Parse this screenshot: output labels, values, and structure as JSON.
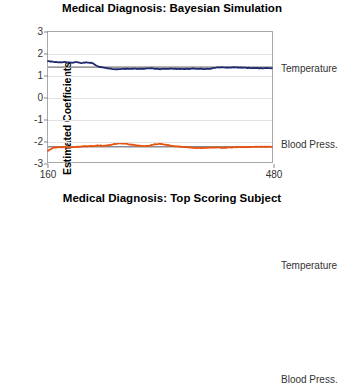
{
  "charts": [
    {
      "title": "Medical Diagnosis: Bayesian Simulation",
      "ylabel": "Estimated Coefficients",
      "yticks": [
        "3",
        "2",
        "1",
        "0",
        "-1",
        "-2",
        "-3"
      ],
      "xticks": [
        "160",
        "480"
      ],
      "legend": {
        "temperature": "Temperature",
        "blood": "Blood Press."
      }
    },
    {
      "title": "Medical Diagnosis: Top Scoring Subject",
      "ylabel": "Estimated Coefficients",
      "yticks": [
        "3",
        "2",
        "1",
        "0",
        "-1",
        "-2",
        "-3",
        "-4"
      ],
      "xticks": [
        "160",
        "480"
      ],
      "legend": {
        "temperature": "Temperature",
        "blood": "Blood Press."
      }
    }
  ],
  "chart_data": [
    {
      "type": "line",
      "title": "Medical Diagnosis: Bayesian Simulation",
      "xlabel": "",
      "ylabel": "Estimated Coefficients",
      "xlim": [
        160,
        480
      ],
      "ylim": [
        -3,
        3
      ],
      "xticks": [
        160,
        480
      ],
      "yticks": [
        -3,
        -2,
        -1,
        0,
        1,
        2,
        3
      ],
      "grid": "horizontal-light",
      "legend_position": "right-outside",
      "reference_lines": [
        {
          "name": "Temperature true value",
          "y": 1.38,
          "color": "#404040"
        },
        {
          "name": "Blood Press. true value",
          "y": -2.3,
          "color": "#404040"
        }
      ],
      "series": [
        {
          "name": "Temperature",
          "color": "#1f2a6e",
          "x": [
            160,
            168,
            176,
            184,
            192,
            200,
            208,
            216,
            224,
            232,
            240,
            248,
            256,
            264,
            272,
            280,
            288,
            296,
            304,
            312,
            320,
            328,
            336,
            344,
            352,
            360,
            368,
            376,
            384,
            392,
            400,
            408,
            416,
            424,
            432,
            440,
            448,
            456,
            464,
            472,
            480
          ],
          "values": [
            1.66,
            1.62,
            1.6,
            1.62,
            1.58,
            1.61,
            1.57,
            1.6,
            1.56,
            1.4,
            1.36,
            1.31,
            1.28,
            1.29,
            1.3,
            1.31,
            1.3,
            1.31,
            1.32,
            1.31,
            1.29,
            1.3,
            1.31,
            1.3,
            1.29,
            1.3,
            1.31,
            1.3,
            1.29,
            1.31,
            1.36,
            1.37,
            1.36,
            1.37,
            1.36,
            1.35,
            1.34,
            1.34,
            1.33,
            1.33,
            1.33
          ]
        },
        {
          "name": "Blood Press.",
          "color": "#e8520e",
          "x": [
            160,
            168,
            176,
            184,
            192,
            200,
            208,
            216,
            224,
            232,
            240,
            248,
            256,
            264,
            272,
            280,
            288,
            296,
            304,
            312,
            320,
            328,
            336,
            344,
            352,
            360,
            368,
            376,
            384,
            392,
            400,
            408,
            416,
            424,
            432,
            440,
            448,
            456,
            464,
            472,
            480
          ],
          "values": [
            -2.48,
            -2.33,
            -2.32,
            -2.31,
            -2.32,
            -2.31,
            -2.28,
            -2.27,
            -2.26,
            -2.24,
            -2.25,
            -2.22,
            -2.16,
            -2.14,
            -2.16,
            -2.2,
            -2.24,
            -2.27,
            -2.26,
            -2.18,
            -2.17,
            -2.2,
            -2.25,
            -2.28,
            -2.3,
            -2.32,
            -2.34,
            -2.36,
            -2.35,
            -2.34,
            -2.33,
            -2.34,
            -2.33,
            -2.32,
            -2.32,
            -2.31,
            -2.31,
            -2.3,
            -2.3,
            -2.3,
            -2.3
          ]
        }
      ]
    },
    {
      "type": "line",
      "title": "Medical Diagnosis: Top Scoring Subject",
      "xlabel": "",
      "ylabel": "Estimated Coefficients",
      "xlim": [
        160,
        480
      ],
      "ylim": [
        -4,
        3
      ],
      "xticks": [
        160,
        480
      ],
      "yticks": [
        -4,
        -3,
        -2,
        -1,
        0,
        1,
        2,
        3
      ],
      "grid": "horizontal-light",
      "legend_position": "right-outside",
      "reference_lines": [
        {
          "name": "Temperature true value",
          "y": 1.38,
          "color": "#404040"
        },
        {
          "name": "Blood Press. true value",
          "y": -2.3,
          "color": "#404040"
        }
      ],
      "series": [
        {
          "name": "Temperature",
          "color": "#1f2a6e",
          "x": [
            160,
            168,
            176,
            184,
            192,
            200,
            208,
            216,
            224,
            232,
            240,
            248,
            256,
            264,
            272,
            280,
            288,
            296,
            304,
            312,
            320,
            328,
            336,
            344,
            352,
            360,
            368,
            376,
            384,
            392,
            400,
            408,
            416,
            424,
            432,
            440,
            448,
            456,
            464,
            472,
            480
          ],
          "values": [
            1.32,
            1.33,
            1.45,
            1.66,
            1.82,
            1.92,
            1.98,
            2.02,
            2.05,
            2.08,
            2.12,
            2.13,
            2.15,
            2.18,
            2.21,
            2.24,
            2.28,
            2.33,
            2.4,
            2.48,
            2.58,
            2.65,
            2.63,
            2.52,
            2.34,
            2.26,
            2.24,
            2.26,
            2.23,
            2.24,
            2.27,
            2.3,
            2.28,
            2.29,
            2.27,
            2.28,
            2.29,
            2.28,
            2.27,
            2.28,
            2.28
          ]
        },
        {
          "name": "Blood Press.",
          "color": "#e8520e",
          "x": [
            160,
            168,
            176,
            184,
            192,
            200,
            208,
            216,
            224,
            232,
            240,
            248,
            256,
            264,
            272,
            280,
            288,
            296,
            304,
            312,
            320,
            328,
            336,
            344,
            352,
            360,
            368,
            376,
            384,
            392,
            400,
            408,
            416,
            424,
            432,
            440,
            448,
            456,
            464,
            472,
            480
          ],
          "values": [
            -1.3,
            -1.33,
            -1.45,
            -1.65,
            -1.82,
            -1.92,
            -1.98,
            -2.02,
            -2.06,
            -2.1,
            -2.14,
            -2.18,
            -2.22,
            -2.3,
            -2.28,
            -2.22,
            -2.2,
            -2.22,
            -2.24,
            -2.23,
            -2.24,
            -2.25,
            -2.26,
            -2.28,
            -2.3,
            -2.33,
            -2.36,
            -2.4,
            -2.45,
            -2.5,
            -2.55,
            -2.58,
            -2.62,
            -2.66,
            -2.7,
            -2.74,
            -2.78,
            -2.82,
            -2.86,
            -2.84,
            -2.82
          ]
        }
      ]
    }
  ]
}
